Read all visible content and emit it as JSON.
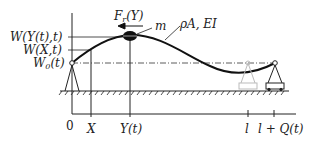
{
  "diagram": {
    "labels": {
      "force": "F",
      "force_sub": "r",
      "force_arg": "(Y)",
      "mass": "m",
      "beam_props": "ρA, EI",
      "w_yt": "W(Y(t),t)",
      "w_xt": "W(X,t)",
      "w0": "W",
      "w0_sub": "0",
      "w0_arg": "(t)"
    },
    "axis_ticks": [
      {
        "label": "0",
        "x": 72
      },
      {
        "label": "X",
        "x": 91
      },
      {
        "label": "Y(t)",
        "x": 130
      },
      {
        "label": "l",
        "x": 248
      },
      {
        "label": "l + Q(t)",
        "x": 274
      }
    ],
    "colors": {
      "line": "#222222",
      "ghost_support": "#bbbbbb"
    }
  }
}
